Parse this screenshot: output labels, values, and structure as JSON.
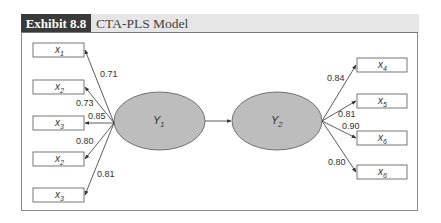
{
  "header": {
    "exhibit_label": "Exhibit 8.8",
    "title": "CTA-PLS Model"
  },
  "colors": {
    "tab_bg": "#3a3a3a",
    "band_bg": "#e6e6e6",
    "ellipse_fill": "#bdbdbd",
    "line": "#333333"
  },
  "latent": [
    {
      "id": "Y1",
      "label": "Y",
      "sub": "1",
      "cx": 159,
      "cy": 121
    },
    {
      "id": "Y2",
      "label": "Y",
      "sub": "2",
      "cx": 277,
      "cy": 121
    }
  ],
  "path": {
    "from": "Y1",
    "to": "Y2"
  },
  "indicators_left": [
    {
      "label": "x",
      "sub": "1",
      "loading": "0.71",
      "y": 43
    },
    {
      "label": "x",
      "sub": "2",
      "loading": "0.73",
      "y": 80
    },
    {
      "label": "x",
      "sub": "3",
      "loading": "0.85",
      "y": 116
    },
    {
      "label": "x",
      "sub": "2",
      "loading": "0.80",
      "y": 152
    },
    {
      "label": "x",
      "sub": "3",
      "loading": "0.81",
      "y": 188
    }
  ],
  "indicators_right": [
    {
      "label": "x",
      "sub": "4",
      "loading": "0.84",
      "y": 58
    },
    {
      "label": "x",
      "sub": "5",
      "loading": "0.81",
      "y": 94
    },
    {
      "label": "x",
      "sub": "6",
      "loading": "0.90",
      "y": 131
    },
    {
      "label": "x",
      "sub": "6",
      "loading": "0.80",
      "y": 165
    }
  ]
}
